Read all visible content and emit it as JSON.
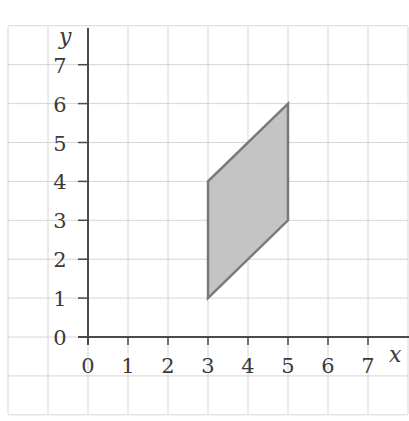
{
  "chart_data": {
    "type": "diagram",
    "title": "",
    "xlabel": "x",
    "ylabel": "y",
    "xlim": [
      -2,
      8
    ],
    "ylim": [
      -2,
      8
    ],
    "grid": true,
    "x_ticks": [
      "0",
      "1",
      "2",
      "3",
      "4",
      "5",
      "6",
      "7"
    ],
    "y_ticks": [
      "0",
      "1",
      "2",
      "3",
      "4",
      "5",
      "6",
      "7"
    ],
    "shapes": [
      {
        "name": "parallelogram",
        "fill": "#c4c4c4",
        "stroke": "#7a7a7a",
        "vertices": [
          [
            3,
            1
          ],
          [
            3,
            4
          ],
          [
            5,
            6
          ],
          [
            5,
            3
          ]
        ]
      }
    ]
  },
  "axes": {
    "x_label": "x",
    "y_label": "y",
    "x_ticks": [
      "0",
      "1",
      "2",
      "3",
      "4",
      "5",
      "6",
      "7"
    ],
    "y_ticks": [
      "0",
      "1",
      "2",
      "3",
      "4",
      "5",
      "6",
      "7"
    ]
  },
  "colors": {
    "grid": "#d6d6d6",
    "axis": "#4a4a4a",
    "shape_fill": "#c4c4c4",
    "shape_stroke": "#7a7a7a"
  }
}
